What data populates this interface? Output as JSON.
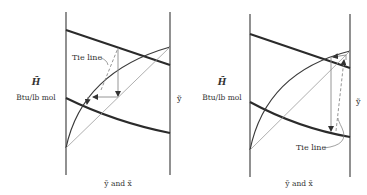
{
  "figure": {
    "panels": [
      {
        "id": "left",
        "y_axis_symbol": "H̃",
        "y_axis_unit": "Btu/lb mol",
        "right_axis_label": "ỹ",
        "x_axis_label": "ỹ and x̃",
        "annotation": "Tie line"
      },
      {
        "id": "right",
        "y_axis_symbol": "H̃",
        "y_axis_unit": "Btu/lb mol",
        "right_axis_label": "ỹ",
        "x_axis_label": "ỹ and x̃",
        "annotation": "Tie line"
      }
    ]
  }
}
